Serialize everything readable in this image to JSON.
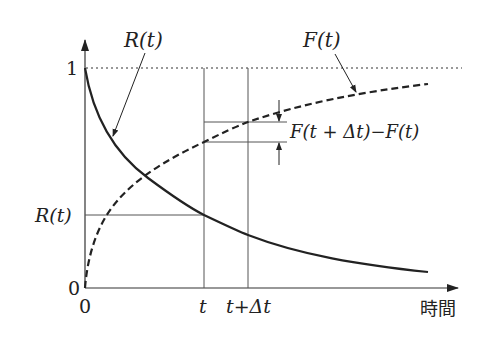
{
  "diagram": {
    "axes": {
      "x_label": "時間",
      "y_tick_top": "1",
      "y_tick_bottom": "0",
      "x_tick_origin": "0",
      "x_tick_t": "t",
      "x_tick_t_dt": "t+Δt",
      "y_tick_rt": "R(t)"
    },
    "curves": [
      {
        "name": "R(t)",
        "style": "solid",
        "description": "decreasing from 1 toward 0"
      },
      {
        "name": "F(t)",
        "style": "dashed",
        "description": "increasing from 0 toward 1"
      }
    ],
    "annotations": {
      "rt_label": "R(t)",
      "ft_label": "F(t)",
      "difference_label": "F(t + Δt)−F(t)"
    },
    "asymptote": {
      "value": "1",
      "style": "dotted"
    },
    "colors": {
      "ink": "#222222",
      "guide": "#555555",
      "background": "#ffffff"
    }
  }
}
